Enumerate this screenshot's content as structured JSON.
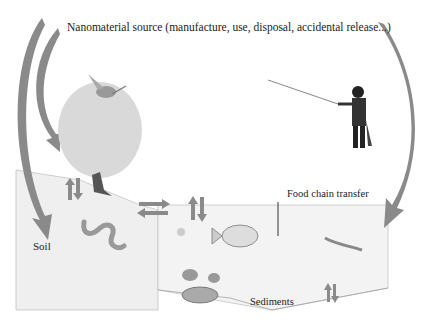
{
  "diagram": {
    "title": "Nanomaterial source (manufacture, use, disposal, accidental release...)",
    "compartments": {
      "soil": "Soil",
      "water_label": "Food chain transfer",
      "sediments": "Sediments"
    },
    "organisms": [
      "bird-icon",
      "tree-icon",
      "fisherman-icon",
      "worm-icon",
      "fish-icon",
      "shrimp-icon",
      "crab-icon",
      "plankton-icon"
    ],
    "arrow_color": "#8a8a8a",
    "panel_color": "#f0f0f0"
  }
}
